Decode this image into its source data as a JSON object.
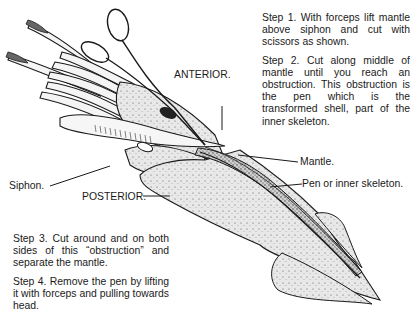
{
  "diagram": {
    "labels": {
      "anterior": "ANTERIOR.",
      "posterior": "POSTERIOR.",
      "siphon": "Siphon.",
      "mantle": "Mantle.",
      "pen": "Pen or inner skeleton."
    },
    "steps_top": [
      "Step 1. With forceps lift mantle above siphon and cut with scissors as shown.",
      "Step 2. Cut along middle of mantle until you reach an obstruction. This obstruction is the pen which is the transformed shell, part of the inner skeleton."
    ],
    "steps_bottom": [
      "Step 3. Cut around and on both sides of this “obstruction” and separate the mantle.",
      "Step 4. Remove the pen by lifting it with forceps and pulling towards head."
    ],
    "colors": {
      "ink": "#1a1a1a",
      "body_fill": "#e6e6e6",
      "background": "#ffffff"
    }
  }
}
